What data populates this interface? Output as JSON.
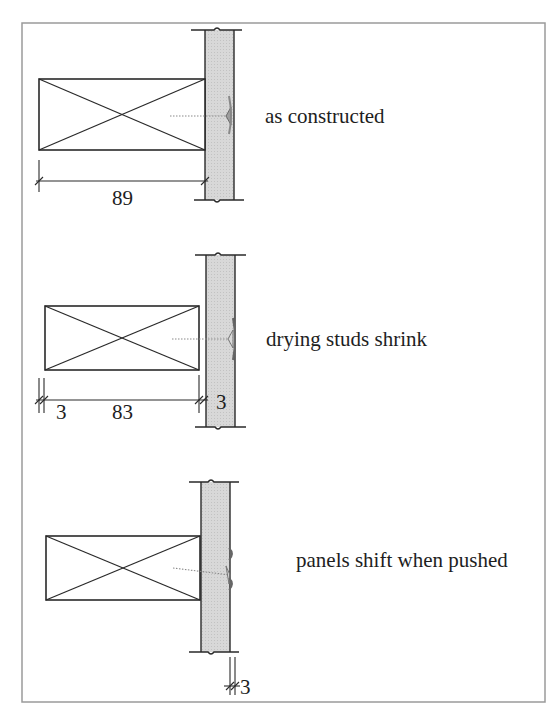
{
  "diagram": {
    "type": "construction-detail",
    "colors": {
      "frame": "#9a9a9a",
      "line": "#2a2a2a",
      "panel_fill": "#d6d6d6",
      "screw": "#8a8a8a"
    },
    "panels": [
      {
        "id": "as-constructed",
        "label": "as constructed",
        "dimensions": [
          {
            "value": "89",
            "meaning": "stud depth"
          }
        ]
      },
      {
        "id": "drying-studs-shrink",
        "label": "drying studs shrink",
        "dimensions": [
          {
            "value": "3",
            "meaning": "shrinkage at back"
          },
          {
            "value": "83",
            "meaning": "dried stud depth"
          },
          {
            "value": "3",
            "meaning": "gap at panel face"
          }
        ]
      },
      {
        "id": "panels-shift-when-pushed",
        "label": "panels shift when pushed",
        "dimensions": [
          {
            "value": "3",
            "meaning": "panel shift"
          }
        ]
      }
    ]
  }
}
